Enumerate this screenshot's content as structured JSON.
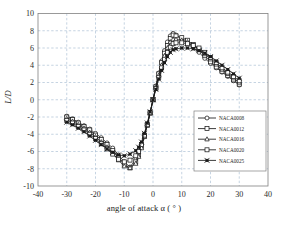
{
  "chart_data": {
    "type": "line",
    "title": "",
    "xlabel": "angle of attack  α ( ° )",
    "ylabel": "L/D",
    "xlim": [
      -40,
      40
    ],
    "ylim": [
      -10,
      10
    ],
    "xticks": [
      -40,
      -30,
      -20,
      -10,
      0,
      10,
      20,
      30,
      40
    ],
    "yticks": [
      10,
      8,
      6,
      4,
      2,
      0,
      -2,
      -4,
      -6,
      -8,
      -10
    ],
    "grid": true,
    "legend_position": "lower-right-inside",
    "series": [
      {
        "name": "NACA0008",
        "marker": "circle",
        "x": [
          -30,
          -28,
          -26,
          -24,
          -22,
          -20,
          -18,
          -16,
          -14,
          -12,
          -10,
          -8,
          -6,
          -5,
          -4,
          -3,
          -2,
          -1,
          0,
          1,
          2,
          3,
          4,
          5,
          6,
          7,
          8,
          10,
          12,
          14,
          16,
          18,
          20,
          22,
          24,
          26,
          28,
          30
        ],
        "values": [
          -1.9,
          -2.2,
          -2.6,
          -3.0,
          -3.4,
          -3.9,
          -4.4,
          -5.0,
          -5.6,
          -6.4,
          -7.2,
          -7.8,
          -6.9,
          -6.2,
          -5.2,
          -4.0,
          -2.8,
          -1.5,
          0.0,
          1.6,
          3.1,
          4.5,
          5.7,
          6.7,
          7.4,
          7.7,
          7.5,
          7.0,
          6.6,
          6.1,
          5.5,
          4.8,
          4.2,
          3.7,
          3.2,
          2.7,
          2.2,
          1.7
        ]
      },
      {
        "name": "NACA0012",
        "marker": "square",
        "x": [
          -30,
          -28,
          -26,
          -24,
          -22,
          -20,
          -18,
          -16,
          -14,
          -12,
          -10,
          -8,
          -6,
          -5,
          -4,
          -3,
          -2,
          -1,
          0,
          1,
          2,
          3,
          4,
          5,
          6,
          7,
          8,
          10,
          12,
          14,
          16,
          18,
          20,
          22,
          24,
          26,
          28,
          30
        ],
        "values": [
          -2.0,
          -2.3,
          -2.7,
          -3.1,
          -3.5,
          -4.1,
          -4.6,
          -5.2,
          -5.9,
          -6.7,
          -7.5,
          -7.9,
          -7.2,
          -6.4,
          -5.4,
          -4.2,
          -2.9,
          -1.5,
          0.0,
          1.5,
          3.0,
          4.3,
          5.4,
          6.3,
          7.1,
          7.5,
          7.4,
          7.2,
          6.9,
          6.4,
          5.8,
          5.1,
          4.4,
          3.8,
          3.3,
          2.8,
          2.3,
          1.8
        ]
      },
      {
        "name": "NACA0016",
        "marker": "triangle",
        "x": [
          -30,
          -28,
          -26,
          -24,
          -22,
          -20,
          -18,
          -16,
          -14,
          -12,
          -10,
          -8,
          -6,
          -5,
          -4,
          -3,
          -2,
          -1,
          0,
          1,
          2,
          3,
          4,
          5,
          6,
          7,
          8,
          10,
          12,
          14,
          16,
          18,
          20,
          22,
          24,
          26,
          28,
          30
        ],
        "values": [
          -2.2,
          -2.5,
          -2.9,
          -3.3,
          -3.8,
          -4.3,
          -4.9,
          -5.5,
          -6.2,
          -7.0,
          -7.7,
          -7.9,
          -7.4,
          -6.6,
          -5.6,
          -4.3,
          -3.0,
          -1.6,
          0.0,
          1.4,
          2.8,
          4.0,
          5.1,
          6.0,
          6.7,
          7.0,
          7.0,
          6.9,
          6.7,
          6.3,
          5.9,
          5.3,
          4.7,
          4.1,
          3.5,
          3.0,
          2.5,
          2.0
        ]
      },
      {
        "name": "NACA0020",
        "marker": "square-open",
        "x": [
          -30,
          -28,
          -26,
          -24,
          -22,
          -20,
          -18,
          -16,
          -14,
          -12,
          -10,
          -8,
          -6,
          -5,
          -4,
          -3,
          -2,
          -1,
          0,
          1,
          2,
          3,
          4,
          5,
          6,
          7,
          8,
          10,
          12,
          14,
          16,
          18,
          20,
          22,
          24,
          26,
          28,
          30
        ],
        "values": [
          -2.4,
          -2.7,
          -3.1,
          -3.5,
          -4.0,
          -4.5,
          -5.1,
          -5.7,
          -6.3,
          -6.9,
          -7.2,
          -7.0,
          -6.5,
          -6.0,
          -5.2,
          -4.1,
          -2.9,
          -1.5,
          0.0,
          1.3,
          2.6,
          3.7,
          4.7,
          5.5,
          6.1,
          6.5,
          6.6,
          6.6,
          6.5,
          6.3,
          6.0,
          5.5,
          4.9,
          4.3,
          3.7,
          3.2,
          2.7,
          2.2
        ]
      },
      {
        "name": "NACA0025",
        "marker": "x-star",
        "x": [
          -30,
          -28,
          -26,
          -24,
          -22,
          -20,
          -18,
          -16,
          -14,
          -12,
          -10,
          -8,
          -6,
          -5,
          -4,
          -3,
          -2,
          -1,
          0,
          1,
          2,
          3,
          4,
          5,
          6,
          7,
          8,
          10,
          12,
          14,
          16,
          18,
          20,
          22,
          24,
          26,
          28,
          30
        ],
        "values": [
          -2.6,
          -2.9,
          -3.3,
          -3.7,
          -4.2,
          -4.7,
          -5.2,
          -5.7,
          -6.1,
          -6.4,
          -6.5,
          -6.3,
          -5.9,
          -5.5,
          -4.9,
          -3.9,
          -2.7,
          -1.4,
          0.0,
          1.2,
          2.4,
          3.4,
          4.3,
          5.0,
          5.5,
          5.8,
          5.9,
          6.0,
          6.0,
          5.9,
          5.7,
          5.4,
          5.0,
          4.5,
          4.0,
          3.5,
          3.0,
          2.5
        ]
      }
    ]
  },
  "axis": {
    "x_label": "angle of attack  α ( ° )",
    "y_label": "L/D"
  },
  "colors": {
    "line": "#1a1a1a",
    "grid": "#9fb7cf",
    "frame": "#808080",
    "background": "#ffffff",
    "text": "#2a2a2a"
  }
}
